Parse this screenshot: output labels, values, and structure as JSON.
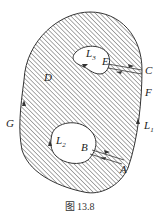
{
  "figure": {
    "caption": "图 13.8",
    "labels": {
      "L3": "L",
      "L3_sub": "3",
      "E": "E",
      "C": "C",
      "D": "D",
      "F": "F",
      "G": "G",
      "L1": "L",
      "L1_sub": "1",
      "L2": "L",
      "L2_sub": "2",
      "B": "B",
      "A": "A"
    },
    "colors": {
      "stroke": "#333333",
      "hatch": "#444444",
      "background": "#ffffff"
    }
  }
}
